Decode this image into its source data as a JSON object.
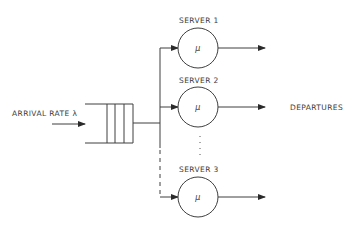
{
  "diagram": {
    "arrival": {
      "label": "ARRIVAL RATE λ"
    },
    "queue": {
      "slots": 4
    },
    "servers": [
      {
        "label": "SERVER 1",
        "rate_symbol": "μ"
      },
      {
        "label": "SERVER 2",
        "rate_symbol": "μ"
      },
      {
        "label": "SERVER 3",
        "rate_symbol": "μ"
      }
    ],
    "ellipsis": "⋮",
    "output": {
      "label": "DEPARTURES"
    },
    "colors": {
      "line": "#3f3f3f",
      "text": "#3a3a3a",
      "background": "#ffffff"
    }
  }
}
